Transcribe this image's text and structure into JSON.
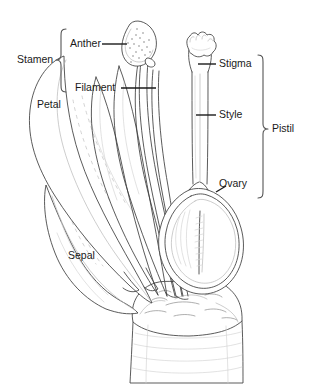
{
  "diagram": {
    "style": "black-and-white line drawing",
    "line_color": "#3d3d3d",
    "text_color": "#1a1a1a",
    "background_color": "#ffffff",
    "bracket_color": "#555555"
  },
  "labels": {
    "stamen": "Stamen",
    "anther": "Anther",
    "filament": "Filament",
    "petal": "Petal",
    "sepal": "Sepal",
    "stigma": "Stigma",
    "style": "Style",
    "ovary": "Ovary",
    "pistil": "Pistil"
  },
  "groups": [
    {
      "name": "Stamen",
      "side": "left",
      "members": [
        "Anther",
        "Filament"
      ]
    },
    {
      "name": "Pistil",
      "side": "right",
      "members": [
        "Stigma",
        "Style",
        "Ovary"
      ]
    }
  ],
  "parts": [
    {
      "name": "Anther",
      "group": "Stamen",
      "side": "left"
    },
    {
      "name": "Filament",
      "group": "Stamen",
      "side": "left"
    },
    {
      "name": "Petal",
      "group": null,
      "side": "left"
    },
    {
      "name": "Sepal",
      "group": null,
      "side": "left"
    },
    {
      "name": "Stigma",
      "group": "Pistil",
      "side": "right"
    },
    {
      "name": "Style",
      "group": "Pistil",
      "side": "right"
    },
    {
      "name": "Ovary",
      "group": "Pistil",
      "side": "right"
    }
  ]
}
